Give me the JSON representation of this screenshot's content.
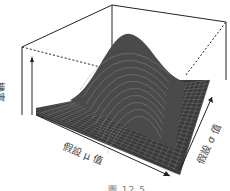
{
  "chart_data": {
    "type": "surface3d",
    "title": "",
    "xlabel": "假設 μ 值",
    "ylabel": "假設 σ 值",
    "zlabel": "機率",
    "grid": false,
    "box": true,
    "peak": {
      "x_rel": 0.55,
      "y_rel": 0.4,
      "z_rel": 1.0
    }
  },
  "figure": {
    "caption": "圖 12.5",
    "axis_labels": {
      "z": "機率",
      "x": "假設 μ 值",
      "y": "假設 σ 值"
    },
    "colors": {
      "surface": "#3a3a3a",
      "mesh": "#8a8a8a",
      "box": "#222222",
      "background": "#ffffff"
    }
  }
}
